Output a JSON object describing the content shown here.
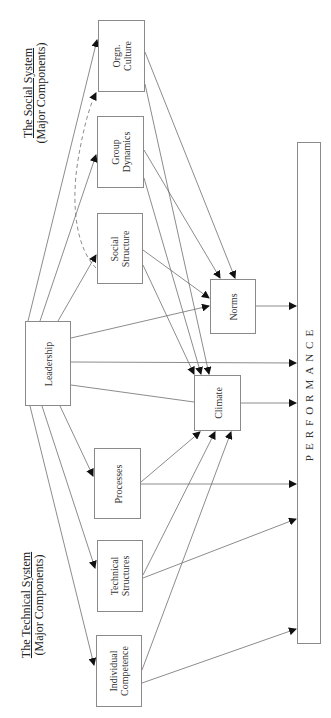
{
  "diagram": {
    "orientation": "rotated-90-ccw",
    "social_system": {
      "title": "The Social System",
      "subtitle": "(Major Components)"
    },
    "technical_system": {
      "title": "The Technical System",
      "subtitle": "(Major Components)"
    },
    "nodes": {
      "leadership": {
        "line1": "Leadership",
        "line2": ""
      },
      "orgn_culture": {
        "line1": "Orgn.",
        "line2": "Culture"
      },
      "group_dynamics": {
        "line1": "Group",
        "line2": "Dynamics"
      },
      "social_structure": {
        "line1": "Social",
        "line2": "Structure"
      },
      "norms": {
        "line1": "Norms",
        "line2": ""
      },
      "climate": {
        "line1": "Climate",
        "line2": ""
      },
      "processes": {
        "line1": "Processes",
        "line2": ""
      },
      "technical_structures": {
        "line1": "Technical",
        "line2": "Structures"
      },
      "individual_competence": {
        "line1": "Individual",
        "line2": "Competence"
      },
      "performance": {
        "line1": "PERFORMANCE",
        "line2": ""
      }
    },
    "edges": [
      {
        "from": "Leadership",
        "to": "Orgn. Culture"
      },
      {
        "from": "Leadership",
        "to": "Group Dynamics"
      },
      {
        "from": "Leadership",
        "to": "Social Structure"
      },
      {
        "from": "Leadership",
        "to": "Norms"
      },
      {
        "from": "Leadership",
        "to": "Climate"
      },
      {
        "from": "Leadership",
        "to": "Performance"
      },
      {
        "from": "Leadership",
        "to": "Processes"
      },
      {
        "from": "Leadership",
        "to": "Technical Structures"
      },
      {
        "from": "Leadership",
        "to": "Individual Competence"
      },
      {
        "from": "Social Structure",
        "to": "Orgn. Culture",
        "style": "dashed"
      },
      {
        "from": "Orgn. Culture",
        "to": "Norms"
      },
      {
        "from": "Orgn. Culture",
        "to": "Climate"
      },
      {
        "from": "Group Dynamics",
        "to": "Norms"
      },
      {
        "from": "Group Dynamics",
        "to": "Climate"
      },
      {
        "from": "Social Structure",
        "to": "Norms"
      },
      {
        "from": "Social Structure",
        "to": "Climate"
      },
      {
        "from": "Norms",
        "to": "Performance"
      },
      {
        "from": "Climate",
        "to": "Performance"
      },
      {
        "from": "Processes",
        "to": "Climate"
      },
      {
        "from": "Processes",
        "to": "Performance"
      },
      {
        "from": "Technical Structures",
        "to": "Climate"
      },
      {
        "from": "Technical Structures",
        "to": "Performance"
      },
      {
        "from": "Individual Competence",
        "to": "Climate"
      },
      {
        "from": "Individual Competence",
        "to": "Performance"
      }
    ],
    "colors": {
      "line": "#6f6f6f",
      "box_border": "#8a8a8a",
      "arrowhead": "#111111"
    }
  }
}
